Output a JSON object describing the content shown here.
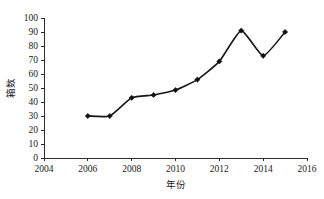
{
  "chart_data": {
    "type": "line",
    "title": "",
    "xlabel": "年份",
    "ylabel": "箱数",
    "x": [
      2006,
      2007,
      2008,
      2009,
      2010,
      2011,
      2012,
      2013,
      2014,
      2015
    ],
    "values": [
      30,
      30,
      43,
      45,
      48.5,
      56,
      69,
      91,
      73,
      90
    ],
    "series": [
      {
        "name": "箱数",
        "values": [
          30,
          30,
          43,
          45,
          48.5,
          56,
          69,
          91,
          73,
          90
        ]
      }
    ],
    "xlim": [
      2004,
      2016
    ],
    "ylim": [
      0,
      100
    ],
    "x_ticks": [
      2004,
      2006,
      2008,
      2010,
      2012,
      2014,
      2016
    ],
    "x_tick_labels": [
      "2004",
      "2006",
      "2008",
      "2010",
      "2012",
      "2014",
      "2016"
    ],
    "y_ticks": [
      0,
      10,
      20,
      30,
      40,
      50,
      60,
      70,
      80,
      90,
      100
    ],
    "y_tick_labels": [
      "0",
      "10",
      "20",
      "30",
      "40",
      "50",
      "60",
      "70",
      "80",
      "90",
      "100"
    ],
    "grid": false,
    "legend": false,
    "legend_position": "none",
    "marker": "diamond",
    "line_color": "#161616",
    "marker_color": "#111111",
    "axis_color": "#2b2b2b",
    "background_color": "#ffffff"
  }
}
